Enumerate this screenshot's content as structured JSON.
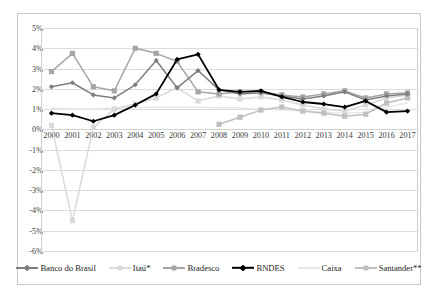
{
  "chart_data": {
    "type": "line",
    "title": "",
    "subtitle": "",
    "xlabel": "",
    "ylabel": "",
    "x": [
      2000,
      2001,
      2002,
      2003,
      2004,
      2005,
      2006,
      2007,
      2008,
      2009,
      2010,
      2011,
      2012,
      2013,
      2014,
      2015,
      2016,
      2017
    ],
    "categories": [
      "2000",
      "2001",
      "2002",
      "2003",
      "2004",
      "2005",
      "2006",
      "2007",
      "2008",
      "2009",
      "2010",
      "2011",
      "2012",
      "2013",
      "2014",
      "2015",
      "2016",
      "2017"
    ],
    "ylim": [
      -6,
      5
    ],
    "yticks": [
      5,
      4,
      3,
      2,
      1,
      0,
      -1,
      -2,
      -3,
      -4,
      -5,
      -6
    ],
    "ytick_labels": [
      "5%",
      "4%",
      "3%",
      "2%",
      "1%",
      "0%",
      "-1%",
      "-2%",
      "-3%",
      "-4%",
      "-5%",
      "-6%"
    ],
    "grid": true,
    "legend_position": "bottom",
    "value_format": "percent",
    "series": [
      {
        "name": "Banco do Brasil",
        "color": "#7f7f7f",
        "marker": "diamond",
        "values": [
          2.1,
          2.3,
          1.7,
          1.55,
          2.2,
          3.4,
          2.05,
          2.9,
          1.95,
          1.75,
          1.8,
          1.65,
          1.5,
          1.65,
          1.85,
          1.45,
          1.65,
          1.75
        ]
      },
      {
        "name": "Itaú*",
        "color": "#d9d9d9",
        "marker": "square",
        "values": [
          0.2,
          -4.5,
          0.1,
          1.0,
          1.25,
          1.55,
          2.05,
          1.4,
          1.65,
          1.5,
          1.6,
          1.45,
          1.2,
          1.0,
          0.9,
          1.2,
          1.55,
          1.7
        ]
      },
      {
        "name": "Bradesco",
        "color": "#a6a6a6",
        "marker": "square",
        "values": [
          2.85,
          3.75,
          2.1,
          1.9,
          4.0,
          3.75,
          3.35,
          1.85,
          1.75,
          1.85,
          1.85,
          1.7,
          1.6,
          1.75,
          1.9,
          1.55,
          1.75,
          1.8
        ]
      },
      {
        "name": "BNDES",
        "color": "#000000",
        "marker": "diamond",
        "values": [
          0.8,
          0.7,
          0.4,
          0.7,
          1.2,
          1.75,
          3.45,
          3.7,
          1.95,
          1.85,
          1.9,
          1.6,
          1.35,
          1.25,
          1.1,
          1.4,
          0.85,
          0.9
        ]
      },
      {
        "name": "Caixa",
        "color": "#e8e8e8",
        "marker": "none",
        "values": [
          1.05,
          1.0,
          1.0,
          1.05,
          1.05,
          1.1,
          1.1,
          1.1,
          1.05,
          1.05,
          1.0,
          0.95,
          0.9,
          0.85,
          0.8,
          0.85,
          1.1,
          1.3
        ]
      },
      {
        "name": "Santander**",
        "color": "#bfbfbf",
        "marker": "square",
        "values": [
          null,
          null,
          null,
          null,
          null,
          null,
          null,
          null,
          0.25,
          0.6,
          0.95,
          1.1,
          0.9,
          0.8,
          0.65,
          0.75,
          1.3,
          1.55
        ]
      }
    ]
  },
  "legend": {
    "items": [
      {
        "label": "Banco do Brasil",
        "color": "#7f7f7f",
        "marker": "diamond"
      },
      {
        "label": "Itaú*",
        "color": "#d9d9d9",
        "marker": "square"
      },
      {
        "label": "Bradesco",
        "color": "#a6a6a6",
        "marker": "square"
      },
      {
        "label": "BNDES",
        "color": "#000000",
        "marker": "diamond"
      },
      {
        "label": "Caixa",
        "color": "#e8e8e8",
        "marker": "none"
      },
      {
        "label": "Santander**",
        "color": "#bfbfbf",
        "marker": "square"
      }
    ]
  }
}
